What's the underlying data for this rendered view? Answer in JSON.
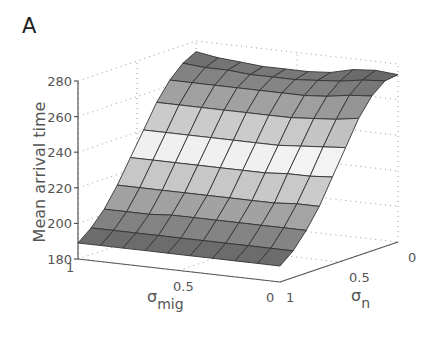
{
  "panel_label": "A",
  "chart_data": {
    "type": "surface3d",
    "title": "",
    "zlabel": "Mean arrival time",
    "xlabel": "σ_mig",
    "ylabel": "σ_n",
    "x_axis": {
      "name": "σ_mig",
      "symbol": "σ",
      "subscript": "mig",
      "ticks": [
        "1",
        "0.5",
        "0"
      ],
      "range": [
        1,
        0
      ]
    },
    "y_axis": {
      "name": "σ_n",
      "symbol": "σ",
      "subscript": "n",
      "ticks": [
        "1",
        "0.5",
        "0"
      ],
      "range": [
        1,
        0
      ]
    },
    "z_axis": {
      "name": "Mean arrival time",
      "ticks": [
        "180",
        "200",
        "220",
        "240",
        "260",
        "280"
      ],
      "range": [
        180,
        280
      ]
    },
    "grid": "dotted",
    "colormap": "gray (dark low, light middle, dark high)",
    "x": [
      1.0,
      0.889,
      0.778,
      0.667,
      0.556,
      0.444,
      0.333,
      0.222,
      0.111,
      0.0
    ],
    "y": [
      1.0,
      0.889,
      0.778,
      0.667,
      0.556,
      0.444,
      0.333,
      0.222,
      0.111,
      0.0
    ],
    "z_profile_along_sigma_n_note": "rows indexed by σ_n from 1 (front) to 0 (back); values nearly independent of σ_mig",
    "z": [
      [
        189,
        189,
        189,
        189,
        189,
        189,
        189,
        189,
        189,
        189
      ],
      [
        195,
        195,
        195,
        195,
        195,
        195,
        195,
        195,
        195,
        195
      ],
      [
        203,
        203,
        203,
        204,
        204,
        204,
        204,
        204,
        204,
        204
      ],
      [
        214,
        214,
        214,
        214,
        214,
        214,
        214,
        214,
        215,
        215
      ],
      [
        227,
        227,
        227,
        227,
        227,
        227,
        227,
        228,
        228,
        229
      ],
      [
        240,
        240,
        240,
        240,
        240,
        240,
        240,
        241,
        242,
        243
      ],
      [
        253,
        253,
        253,
        253,
        253,
        253,
        253,
        254,
        255,
        257
      ],
      [
        263,
        263,
        263,
        263,
        263,
        263,
        263,
        264,
        266,
        267
      ],
      [
        270,
        269,
        269,
        268,
        268,
        268,
        269,
        270,
        272,
        273
      ],
      [
        274,
        272,
        271,
        270,
        270,
        270,
        271,
        274,
        275,
        274
      ]
    ]
  }
}
